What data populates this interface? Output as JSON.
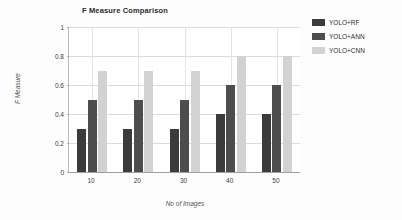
{
  "chart_data": {
    "type": "bar",
    "title": "F Measure Comparison",
    "xlabel": "No of Images",
    "ylabel": "F Measure",
    "categories": [
      "10",
      "20",
      "30",
      "40",
      "50"
    ],
    "series": [
      {
        "name": "YOLO+RF",
        "color": "#3b3b3b",
        "values": [
          0.3,
          0.3,
          0.3,
          0.4,
          0.4
        ]
      },
      {
        "name": "YOLO+ANN",
        "color": "#4d4d4d",
        "values": [
          0.5,
          0.5,
          0.5,
          0.6,
          0.6
        ]
      },
      {
        "name": "YOLO+CNN",
        "color": "#d2d2d2",
        "values": [
          0.7,
          0.7,
          0.7,
          0.8,
          0.8
        ]
      }
    ],
    "ylim": [
      0,
      1
    ],
    "yticks": [
      "0",
      "0.2",
      "0.4",
      "0.6",
      "0.8",
      "1"
    ],
    "ytick_values": [
      0,
      0.2,
      0.4,
      0.6,
      0.8,
      1
    ],
    "grid": true,
    "legend_position": "right"
  }
}
